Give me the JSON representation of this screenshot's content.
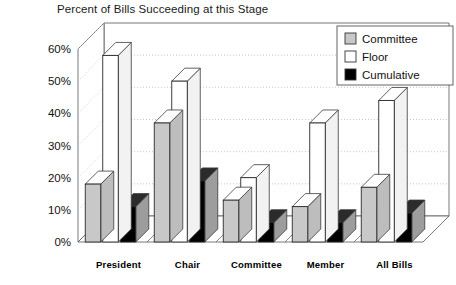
{
  "chart_data": {
    "type": "bar",
    "title": "Percent of Bills Succeeding at this Stage",
    "xlabel": "",
    "ylabel": "",
    "ylim": [
      0,
      60
    ],
    "ytick_step": 10,
    "ytick_labels": [
      "0%",
      "10%",
      "20%",
      "30%",
      "40%",
      "50%",
      "60%"
    ],
    "ytick_values": [
      0,
      10,
      20,
      30,
      40,
      50,
      60
    ],
    "grid": true,
    "grid_style": "dotted",
    "legend_position": "top-right",
    "projection": "3d-bars",
    "categories": [
      "President",
      "Chair",
      "Committee",
      "Member",
      "All Bills"
    ],
    "series": [
      {
        "name": "Committee",
        "color": "#c8c8c8",
        "values": [
          18,
          37,
          13,
          11,
          17
        ]
      },
      {
        "name": "Floor",
        "color": "#ffffff",
        "values": [
          58,
          50,
          20,
          37,
          44
        ]
      },
      {
        "name": "Cumulative",
        "color": "#000000",
        "values": [
          11,
          19,
          6,
          6,
          9
        ]
      }
    ]
  },
  "legend": {
    "items": [
      {
        "label": "Committee",
        "swatch": "#c8c8c8"
      },
      {
        "label": "Floor",
        "swatch": "#ffffff"
      },
      {
        "label": "Cumulative",
        "swatch": "#000000"
      }
    ]
  }
}
